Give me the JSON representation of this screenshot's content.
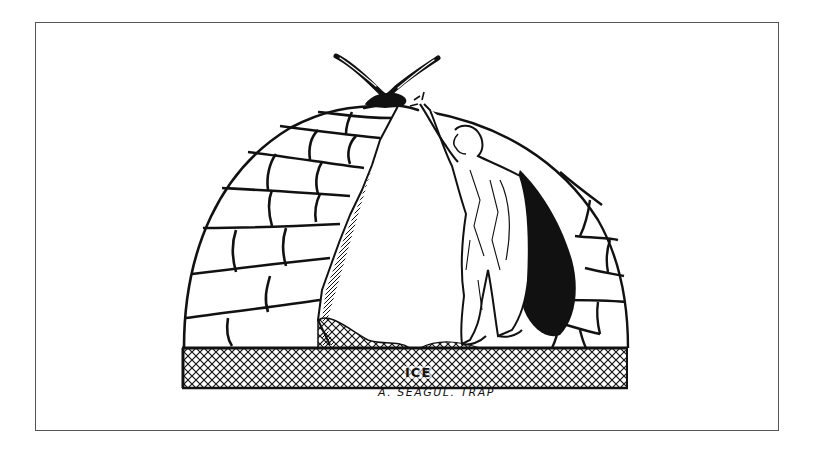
{
  "illustration": {
    "subject": "ink drawing of an igloo cut open, a ragged figure reaching up toward a seagull perched on top",
    "elements": [
      "seagull",
      "igloo",
      "ice-block-wall",
      "ragged-figure",
      "ice-floor-crosshatch"
    ],
    "floor_label": "ICE",
    "caption": "A. SEAGUL. TRAP"
  },
  "colors": {
    "ink": "#111111",
    "paper": "#ffffff",
    "frame": "#555555"
  }
}
